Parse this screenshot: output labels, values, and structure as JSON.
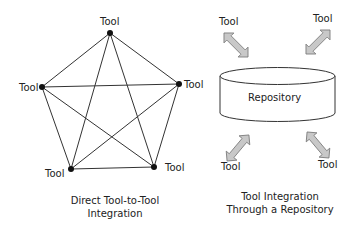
{
  "left_diagram": {
    "nodes": [
      {
        "label": "Tool",
        "x": 110,
        "y": 33
      },
      {
        "label": "Tool",
        "x": 179,
        "y": 84
      },
      {
        "label": "Tool",
        "x": 154,
        "y": 167
      },
      {
        "label": "Tool",
        "x": 71,
        "y": 169
      },
      {
        "label": "Tool",
        "x": 42,
        "y": 87
      }
    ],
    "caption_line1": "Direct Tool-to-Tool",
    "caption_line2": "Integration"
  },
  "right_diagram": {
    "repository_label": "Repository",
    "tools": [
      "Tool",
      "Tool",
      "Tool",
      "Tool"
    ],
    "caption_line1": "Tool Integration",
    "caption_line2": "Through a Repository",
    "arrow_fill": "#c8c8c8"
  }
}
